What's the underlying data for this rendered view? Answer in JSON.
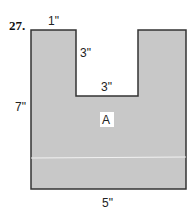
{
  "problem_number": "27.",
  "shape": {
    "fill": "#c8c8c8",
    "stroke": "#333333",
    "region_label": "A"
  },
  "dimensions": {
    "top_left_width": "1\"",
    "notch_depth": "3\"",
    "notch_width": "3\"",
    "left_height": "7\"",
    "bottom_width": "5\""
  }
}
